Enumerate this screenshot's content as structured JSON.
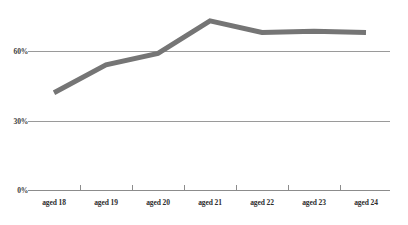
{
  "chart_data": {
    "type": "line",
    "title": "",
    "subtitle": "",
    "xlabel": "",
    "ylabel": "",
    "categories": [
      "aged 18",
      "aged 19",
      "aged 20",
      "aged 21",
      "aged 22",
      "aged 23",
      "aged 24"
    ],
    "series": [
      {
        "name": "",
        "values": [
          42,
          54,
          59,
          73,
          68,
          68.5,
          68
        ],
        "color": "#757575"
      }
    ],
    "ylim": [
      0,
      90
    ],
    "ytick_values": [
      0,
      30,
      60
    ],
    "ytick_labels": [
      "0%",
      "30%",
      "60%"
    ],
    "grid": true,
    "grid_color": "#9a9a9a",
    "axis_color": "#8c8c8c",
    "legend": "none",
    "legend_position": "none",
    "background": "#ffffff",
    "line_width": 5
  }
}
